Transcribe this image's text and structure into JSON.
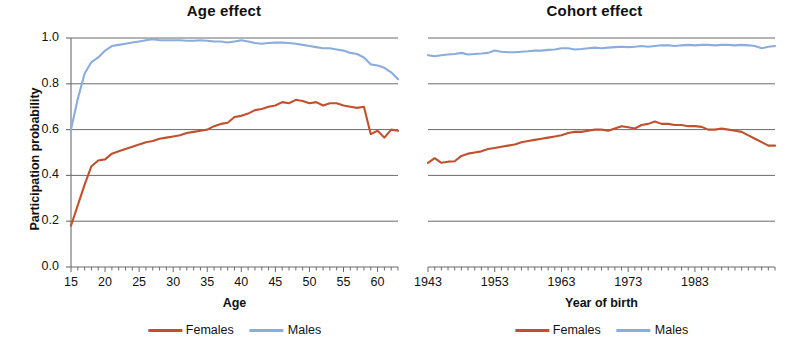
{
  "figure": {
    "background": "#ffffff",
    "grid_color": "#6b6b6b",
    "axis_color": "#6b6b6b",
    "text_color": "#111111"
  },
  "series_colors": {
    "females": "#c1512e",
    "males": "#8badde"
  },
  "legend": {
    "entries": [
      {
        "label": "Females",
        "color": "#c1512e",
        "icon": "line-swatch"
      },
      {
        "label": "Males",
        "color": "#8badde",
        "icon": "line-swatch"
      }
    ]
  },
  "shared_y": {
    "label": "Participation probability",
    "ticks": [
      "0.0",
      "0.2",
      "0.4",
      "0.6",
      "0.8",
      "1.0"
    ],
    "tick_values": [
      0.0,
      0.2,
      0.4,
      0.6,
      0.8,
      1.0
    ],
    "ylim": [
      0.0,
      1.0
    ]
  },
  "chart_data": [
    {
      "id": "age-effect",
      "type": "line",
      "title": "Age effect",
      "xlabel": "Age",
      "ylabel": "Participation probability",
      "xlim": [
        15,
        63
      ],
      "ylim": [
        0.0,
        1.0
      ],
      "xticks": [
        15,
        20,
        25,
        30,
        35,
        40,
        45,
        50,
        55,
        60
      ],
      "xtick_labels": [
        "15",
        "20",
        "25",
        "30",
        "35",
        "40",
        "45",
        "50",
        "55",
        "60"
      ],
      "yticks": [
        0.0,
        0.2,
        0.4,
        0.6,
        0.8,
        1.0
      ],
      "ytick_labels": [
        "0.0",
        "0.2",
        "0.4",
        "0.6",
        "0.8",
        "1.0"
      ],
      "grid": "horizontal",
      "minor_xticks": true,
      "legend_position": "bottom-center",
      "x": [
        15,
        16,
        17,
        18,
        19,
        20,
        21,
        22,
        23,
        24,
        25,
        26,
        27,
        28,
        29,
        30,
        31,
        32,
        33,
        34,
        35,
        36,
        37,
        38,
        39,
        40,
        41,
        42,
        43,
        44,
        45,
        46,
        47,
        48,
        49,
        50,
        51,
        52,
        53,
        54,
        55,
        56,
        57,
        58,
        59,
        60,
        61,
        62,
        63
      ],
      "series": [
        {
          "name": "Females",
          "color": "#c1512e",
          "values": [
            0.18,
            0.27,
            0.36,
            0.44,
            0.465,
            0.47,
            0.495,
            0.505,
            0.515,
            0.525,
            0.535,
            0.545,
            0.55,
            0.56,
            0.565,
            0.57,
            0.575,
            0.585,
            0.59,
            0.595,
            0.6,
            0.615,
            0.625,
            0.63,
            0.655,
            0.66,
            0.67,
            0.685,
            0.69,
            0.7,
            0.705,
            0.72,
            0.715,
            0.73,
            0.725,
            0.715,
            0.72,
            0.705,
            0.715,
            0.715,
            0.705,
            0.7,
            0.695,
            0.7,
            0.58,
            0.595,
            0.565,
            0.6,
            0.595
          ]
        },
        {
          "name": "Males",
          "color": "#8badde",
          "values": [
            0.6,
            0.735,
            0.845,
            0.895,
            0.915,
            0.945,
            0.965,
            0.97,
            0.975,
            0.98,
            0.985,
            0.99,
            0.995,
            0.99,
            0.99,
            0.99,
            0.99,
            0.988,
            0.988,
            0.99,
            0.988,
            0.985,
            0.985,
            0.98,
            0.985,
            0.99,
            0.985,
            0.978,
            0.975,
            0.978,
            0.98,
            0.98,
            0.978,
            0.975,
            0.97,
            0.965,
            0.96,
            0.955,
            0.955,
            0.95,
            0.945,
            0.935,
            0.93,
            0.915,
            0.885,
            0.88,
            0.87,
            0.85,
            0.82
          ]
        }
      ]
    },
    {
      "id": "cohort-effect",
      "type": "line",
      "title": "Cohort effect",
      "xlabel": "Year of birth",
      "ylabel": "",
      "xlim": [
        1943,
        1995
      ],
      "ylim": [
        0.0,
        1.0
      ],
      "xticks": [
        1943,
        1953,
        1963,
        1973,
        1983
      ],
      "xtick_labels": [
        "1943",
        "1953",
        "1963",
        "1973",
        "1983"
      ],
      "yticks": [
        0.0,
        0.2,
        0.4,
        0.6,
        0.8,
        1.0
      ],
      "ytick_labels": [
        "",
        "",
        "",
        "",
        "",
        ""
      ],
      "grid": "horizontal",
      "minor_xticks": true,
      "legend_position": "bottom-center",
      "x": [
        1943,
        1944,
        1945,
        1946,
        1947,
        1948,
        1949,
        1950,
        1951,
        1952,
        1953,
        1954,
        1955,
        1956,
        1957,
        1958,
        1959,
        1960,
        1961,
        1962,
        1963,
        1964,
        1965,
        1966,
        1967,
        1968,
        1969,
        1970,
        1971,
        1972,
        1973,
        1974,
        1975,
        1976,
        1977,
        1978,
        1979,
        1980,
        1981,
        1982,
        1983,
        1984,
        1985,
        1986,
        1987,
        1988,
        1989,
        1990,
        1991,
        1992,
        1993,
        1994,
        1995
      ],
      "series": [
        {
          "name": "Females",
          "color": "#c1512e",
          "values": [
            0.455,
            0.475,
            0.455,
            0.46,
            0.462,
            0.485,
            0.495,
            0.5,
            0.505,
            0.515,
            0.52,
            0.525,
            0.53,
            0.535,
            0.545,
            0.55,
            0.555,
            0.56,
            0.565,
            0.57,
            0.575,
            0.585,
            0.59,
            0.59,
            0.595,
            0.6,
            0.6,
            0.595,
            0.605,
            0.615,
            0.61,
            0.605,
            0.62,
            0.625,
            0.635,
            0.625,
            0.625,
            0.62,
            0.62,
            0.615,
            0.615,
            0.612,
            0.6,
            0.6,
            0.605,
            0.6,
            0.595,
            0.59,
            0.575,
            0.56,
            0.545,
            0.53,
            0.53
          ]
        },
        {
          "name": "Males",
          "color": "#8badde",
          "values": [
            0.925,
            0.92,
            0.925,
            0.928,
            0.93,
            0.935,
            0.928,
            0.93,
            0.932,
            0.935,
            0.945,
            0.94,
            0.938,
            0.938,
            0.94,
            0.942,
            0.945,
            0.945,
            0.948,
            0.95,
            0.955,
            0.955,
            0.95,
            0.952,
            0.955,
            0.958,
            0.955,
            0.958,
            0.96,
            0.962,
            0.96,
            0.962,
            0.965,
            0.962,
            0.965,
            0.968,
            0.968,
            0.965,
            0.968,
            0.97,
            0.968,
            0.97,
            0.97,
            0.968,
            0.97,
            0.97,
            0.968,
            0.97,
            0.968,
            0.965,
            0.955,
            0.962,
            0.965
          ]
        }
      ]
    }
  ]
}
